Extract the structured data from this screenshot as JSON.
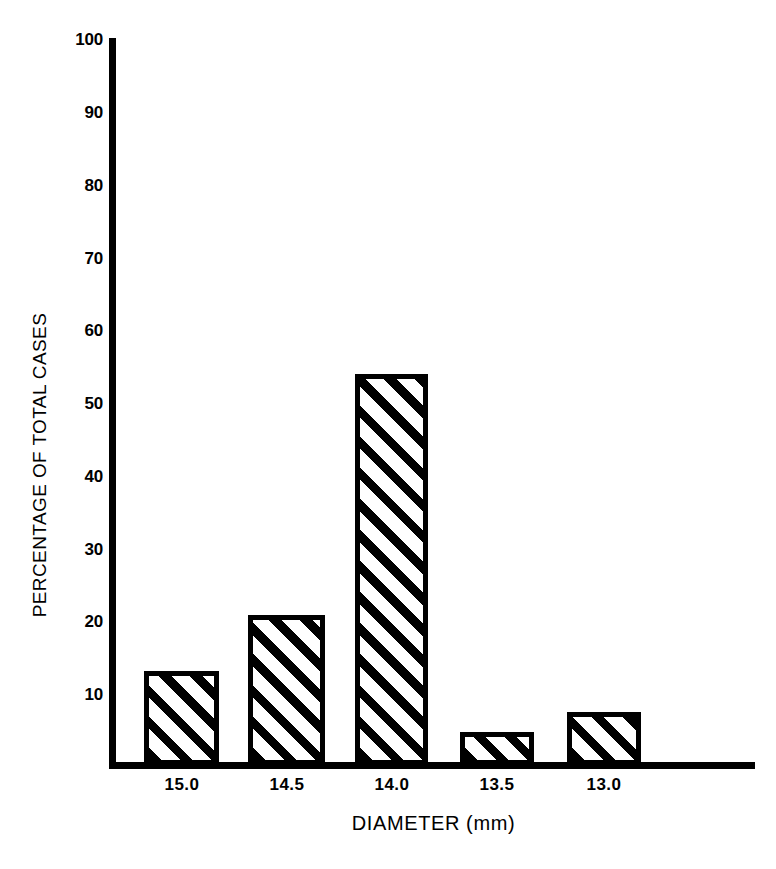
{
  "chart_data": {
    "type": "bar",
    "title": "",
    "xlabel": "DIAMETER (mm)",
    "ylabel": "PERCENTAGE OF TOTAL CASES",
    "categories": [
      "15.0",
      "14.5",
      "14.0",
      "13.5",
      "13.0"
    ],
    "values": [
      13.0,
      20.7,
      53.8,
      4.5,
      7.3
    ],
    "series": [
      {
        "name": "Percentage of total cases",
        "values": [
          13.0,
          20.7,
          53.8,
          4.5,
          7.3
        ]
      }
    ],
    "ylim": [
      0,
      100
    ],
    "ytick_labels": [
      "10",
      "20",
      "30",
      "40",
      "50",
      "60",
      "70",
      "80",
      "90",
      "100"
    ],
    "ytick_values": [
      10,
      20,
      30,
      40,
      50,
      60,
      70,
      80,
      90,
      100
    ],
    "grid": false,
    "legend": "none",
    "bar_fill": "diagonal-hatch",
    "colors": {
      "ink": "#000000",
      "background": "#ffffff"
    }
  }
}
